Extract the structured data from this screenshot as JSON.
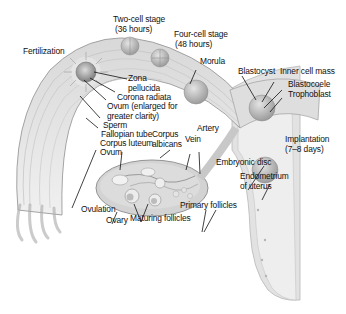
{
  "diagram": {
    "labels": {
      "fertilization": "Fertilization",
      "two_cell_stage": "Two-cell stage",
      "two_cell_time": "(36 hours)",
      "four_cell_stage": "Four-cell stage",
      "four_cell_time": "(48 hours)",
      "morula": "Morula",
      "blastocyst": "Blastocyst",
      "inner_cell_mass": "Inner cell mass",
      "blastocoele": "Blastocoele",
      "trophoblast": "Trophoblast",
      "zona_pellucida_1": "Zona",
      "zona_pellucida_2": "pellucida",
      "corona_radiata": "Corona radiata",
      "ovum_enlarged_1": "Ovum (enlarged for",
      "ovum_enlarged_2": "greater clarity)",
      "sperm": "Sperm",
      "fallopian_tube": "Fallopian tube",
      "corpus_luteum": "Corpus luteum",
      "ovum": "Ovum",
      "corpus_albicans_1": "Corpus",
      "corpus_albicans_2": "albicans",
      "vein": "Vein",
      "artery": "Artery",
      "implantation": "Implantation",
      "implantation_time": "(7–8 days)",
      "embryonic_disc": "Embryonic disc",
      "endometrium_1": "Endometrium",
      "endometrium_2": "of uterus",
      "primary_follicles": "Primary follicles",
      "ovulation": "Ovulation",
      "ovary": "Ovary",
      "maturing_follicles": "Maturing follicles"
    },
    "colors": {
      "tissue_light": "#e6e6e6",
      "tissue_mid": "#cfcfcf",
      "tissue_dark": "#a9a9a9",
      "outline": "#8a8a8a",
      "leader_line": "#111111",
      "background": "#ffffff"
    }
  }
}
